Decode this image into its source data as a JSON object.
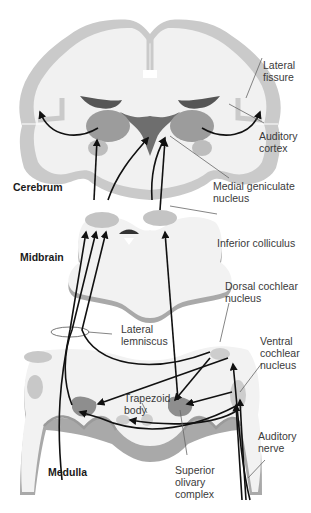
{
  "diagram": {
    "colors": {
      "white_matter": "#f0f0f0",
      "cortex": "#c8c8c8",
      "ventricle": "#5a5a5a",
      "nucleus": "#9a9a9a",
      "brainstem_fill": "#f2f2f2",
      "brainstem_shadow": "#a8a8a8",
      "arrow": "#111111",
      "leader": "#555555",
      "text": "#3a3a3a"
    },
    "regions": {
      "cerebrum": "Cerebrum",
      "midbrain": "Midbrain",
      "medulla": "Medulla"
    },
    "labels": {
      "lateral_fissure": "Lateral\nfissure",
      "auditory_cortex": "Auditory\ncortex",
      "medial_geniculate": "Medial geniculate\nnucleus",
      "inferior_colliculus": "Inferior colliculus",
      "dorsal_cochlear": "Dorsal cochlear\nnucleus",
      "lateral_lemniscus": "Lateral\nlemniscus",
      "ventral_cochlear": "Ventral\ncochlear\nnucleus",
      "trapezoid_body": "Trapezoid\nbody",
      "auditory_nerve": "Auditory\nnerve",
      "superior_olivary": "Superior\nolivary\ncomplex"
    }
  }
}
